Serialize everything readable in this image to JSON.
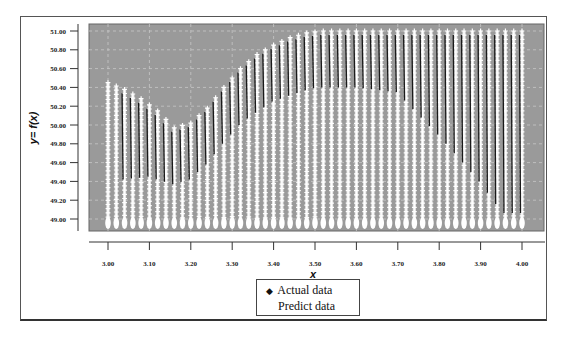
{
  "chart_data": {
    "type": "scatter",
    "title": "",
    "xlabel": "x",
    "ylabel": "y= f(x)",
    "xlim": [
      2.955,
      4.05
    ],
    "ylim": [
      48.93,
      51.08
    ],
    "grid": true,
    "grid_style": "dashed light lines on gray background",
    "legend_position": "bottom-center (below x-axis)",
    "x_ticks": [
      "3.00",
      "3.10",
      "3.20",
      "3.30",
      "3.40",
      "3.50",
      "3.60",
      "3.70",
      "3.80",
      "3.90",
      "4.00"
    ],
    "y_ticks": [
      "49.00",
      "49.20",
      "49.40",
      "49.60",
      "49.80",
      "50.00",
      "50.20",
      "50.40",
      "50.60",
      "50.80",
      "51.00"
    ],
    "legend": [
      "Actual data",
      "Predict data"
    ],
    "plot_background": "#9a9a9a",
    "series": [
      {
        "name": "Actual data",
        "marker": "black diamond / dark line",
        "color": "#111111",
        "description": "Dense dark curves tracing columns; lower envelope falls from ~50.5 at x=3.8 to ~49.4 at x=4.0",
        "x": [
          3.0,
          3.1,
          3.16,
          3.2,
          3.3,
          3.4,
          3.5,
          3.6,
          3.7,
          3.8,
          3.9,
          4.0
        ],
        "y": [
          50.0,
          50.05,
          49.97,
          50.1,
          50.55,
          50.85,
          51.0,
          51.0,
          50.95,
          50.5,
          50.0,
          49.4
        ]
      },
      {
        "name": "Predict data",
        "marker": "white cross/star",
        "color": "#ffffff",
        "description": "Vertical columns of white markers every 0.02 in x, from 49.00 up to an upper envelope",
        "x_start": 3.0,
        "x_end": 4.0,
        "x_step": 0.02,
        "column_bottom": 49.0,
        "upper_envelope": {
          "x": [
            3.0,
            3.04,
            3.08,
            3.12,
            3.16,
            3.2,
            3.24,
            3.28,
            3.32,
            3.36,
            3.4,
            3.44,
            3.48,
            3.52,
            3.56,
            4.0
          ],
          "y": [
            50.45,
            50.38,
            50.28,
            50.15,
            49.97,
            50.02,
            50.18,
            50.4,
            50.6,
            50.75,
            50.85,
            50.93,
            50.98,
            51.0,
            51.0,
            51.0
          ]
        }
      }
    ]
  },
  "axes": {
    "x_title": "x",
    "y_title": "y= f(x)"
  },
  "legend": {
    "items": [
      {
        "label": "Actual data",
        "marker": "◆"
      },
      {
        "label": "Predict data",
        "marker": ""
      }
    ]
  }
}
